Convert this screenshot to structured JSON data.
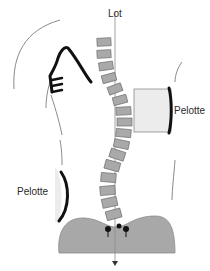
{
  "diagram": {
    "type": "scoliosis-brace-illustration",
    "labels": {
      "plumb_line": "Lot",
      "pad_right": "Pelotte",
      "pad_left": "Pelotte"
    },
    "colors": {
      "vertebra_fill": "#a9a9a9",
      "vertebra_stroke": "#6e6e6e",
      "pelvis_fill": "#a8a8a8",
      "pad_fill": "#ececec",
      "outline": "#8a8a8a",
      "brace": "#111111",
      "text": "#2a2a2a"
    },
    "vertebrae_count": 17
  }
}
